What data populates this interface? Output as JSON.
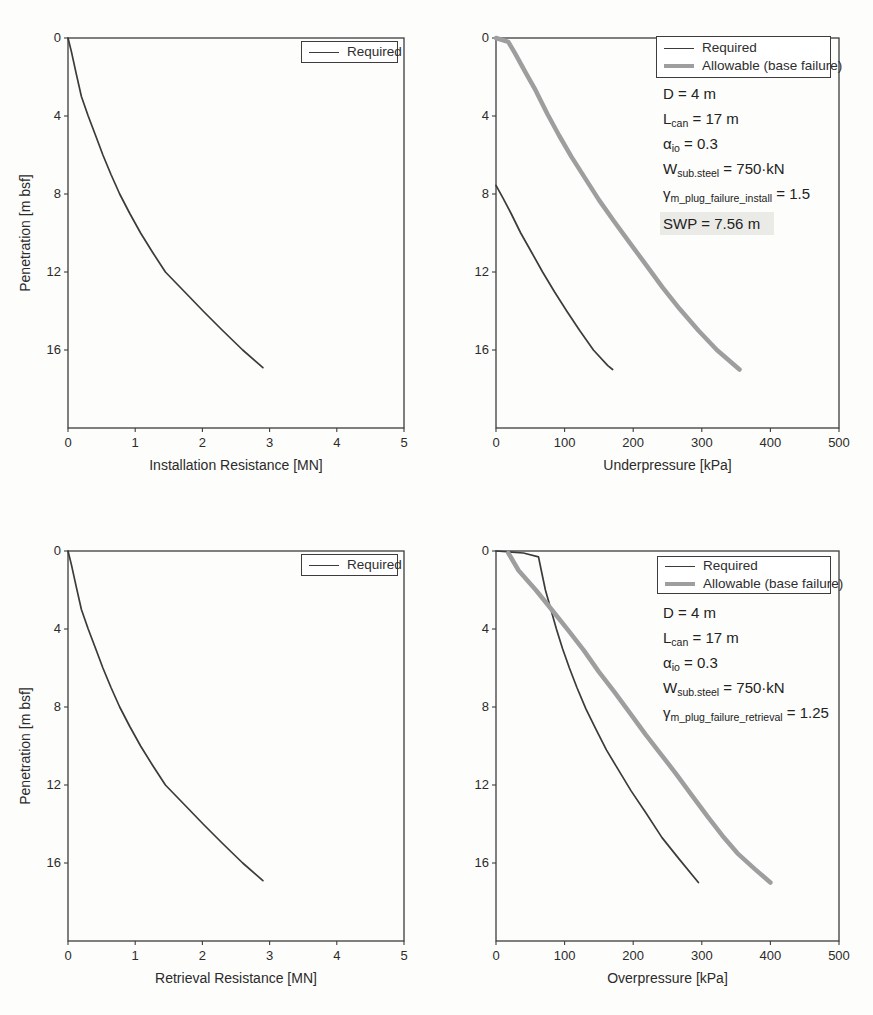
{
  "colors": {
    "required_line": "#3b3b3b",
    "allowable_line": "#9e9e9e",
    "axis": "#3d3d3d",
    "text": "#2b2b2b",
    "highlight_bg": "#eaeae7",
    "background": "#fdfdfb"
  },
  "chart_data": [
    {
      "type": "line",
      "xlabel": "Installation Resistance [MN]",
      "ylabel": "Penetration [m bsf]",
      "xlim": [
        0,
        5
      ],
      "ylim": [
        0,
        20
      ],
      "xticks": [
        0,
        1,
        2,
        3,
        4,
        5
      ],
      "yticks": [
        0,
        4,
        8,
        12,
        16
      ],
      "y_axis_direction": "depth-down",
      "grid": false,
      "legend_position": "top-right",
      "legend": [
        {
          "label": "Required",
          "style": "thin-black"
        }
      ],
      "series": [
        {
          "name": "Required",
          "color": "#3b3b3b",
          "width": 1.7,
          "points": [
            [
              0,
              0
            ],
            [
              0.05,
              0.7
            ],
            [
              0.12,
              1.8
            ],
            [
              0.2,
              3
            ],
            [
              0.3,
              4
            ],
            [
              0.41,
              5
            ],
            [
              0.52,
              6
            ],
            [
              0.64,
              7
            ],
            [
              0.77,
              8
            ],
            [
              0.92,
              9
            ],
            [
              1.08,
              10
            ],
            [
              1.26,
              11
            ],
            [
              1.45,
              12
            ],
            [
              1.73,
              13
            ],
            [
              2.01,
              14
            ],
            [
              2.3,
              15
            ],
            [
              2.6,
              16
            ],
            [
              2.9,
              16.9
            ]
          ]
        }
      ],
      "annotations": []
    },
    {
      "type": "line",
      "xlabel": "Underpressure [kPa]",
      "ylabel": "",
      "xlim": [
        0,
        500
      ],
      "ylim": [
        0,
        20
      ],
      "xticks": [
        0,
        100,
        200,
        300,
        400,
        500
      ],
      "yticks": [
        0,
        4,
        8,
        12,
        16
      ],
      "y_axis_direction": "depth-down",
      "grid": false,
      "legend_position": "top-right",
      "legend": [
        {
          "label": "Required",
          "style": "thin-black"
        },
        {
          "label": "Allowable (base failure)",
          "style": "thick-gray"
        }
      ],
      "series": [
        {
          "name": "Required",
          "color": "#3b3b3b",
          "width": 1.7,
          "points": [
            [
              0,
              7.56
            ],
            [
              10,
              8.2
            ],
            [
              22,
              9
            ],
            [
              36,
              10
            ],
            [
              52,
              11
            ],
            [
              68,
              12
            ],
            [
              85,
              13
            ],
            [
              103,
              14
            ],
            [
              122,
              15
            ],
            [
              142,
              16
            ],
            [
              163,
              16.8
            ],
            [
              170,
              17
            ]
          ]
        },
        {
          "name": "Allowable (base failure)",
          "color": "#9e9e9e",
          "width": 4.5,
          "points": [
            [
              0,
              0
            ],
            [
              18,
              0.2
            ],
            [
              28,
              0.8
            ],
            [
              42,
              1.7
            ],
            [
              58,
              2.7
            ],
            [
              75,
              3.9
            ],
            [
              92,
              5
            ],
            [
              110,
              6.1
            ],
            [
              130,
              7.2
            ],
            [
              150,
              8.3
            ],
            [
              172,
              9.4
            ],
            [
              195,
              10.5
            ],
            [
              218,
              11.6
            ],
            [
              243,
              12.8
            ],
            [
              268,
              13.9
            ],
            [
              295,
              15
            ],
            [
              322,
              16
            ],
            [
              355,
              17
            ]
          ]
        }
      ],
      "annotations": [
        {
          "base": "D",
          "sub": "",
          "rest": " = 4 m"
        },
        {
          "base": "L",
          "sub": "can",
          "rest": " = 17 m"
        },
        {
          "base": "α",
          "sub": "io",
          "rest": " = 0.3"
        },
        {
          "base": "W",
          "sub": "sub.steel",
          "rest": " = 750·kN"
        },
        {
          "base": "γ",
          "sub": "m_plug_failure_install",
          "rest": " = 1.5"
        },
        {
          "base": "SWP",
          "sub": "",
          "rest": " = 7.56 m",
          "highlight": true
        }
      ]
    },
    {
      "type": "line",
      "xlabel": "Retrieval Resistance [MN]",
      "ylabel": "Penetration [m bsf]",
      "xlim": [
        0,
        5
      ],
      "ylim": [
        0,
        20
      ],
      "xticks": [
        0,
        1,
        2,
        3,
        4,
        5
      ],
      "yticks": [
        0,
        4,
        8,
        12,
        16
      ],
      "y_axis_direction": "depth-down",
      "grid": false,
      "legend_position": "top-right",
      "legend": [
        {
          "label": "Required",
          "style": "thin-black"
        }
      ],
      "series": [
        {
          "name": "Required",
          "color": "#3b3b3b",
          "width": 1.7,
          "points": [
            [
              0,
              0
            ],
            [
              0.05,
              0.7
            ],
            [
              0.12,
              1.8
            ],
            [
              0.2,
              3
            ],
            [
              0.3,
              4
            ],
            [
              0.41,
              5
            ],
            [
              0.52,
              6
            ],
            [
              0.64,
              7
            ],
            [
              0.77,
              8
            ],
            [
              0.92,
              9
            ],
            [
              1.08,
              10
            ],
            [
              1.26,
              11
            ],
            [
              1.45,
              12
            ],
            [
              1.73,
              13
            ],
            [
              2.01,
              14
            ],
            [
              2.3,
              15
            ],
            [
              2.6,
              16
            ],
            [
              2.9,
              16.9
            ]
          ]
        }
      ],
      "annotations": []
    },
    {
      "type": "line",
      "xlabel": "Overpressure [kPa]",
      "ylabel": "",
      "xlim": [
        0,
        500
      ],
      "ylim": [
        0,
        20
      ],
      "xticks": [
        0,
        100,
        200,
        300,
        400,
        500
      ],
      "yticks": [
        0,
        4,
        8,
        12,
        16
      ],
      "y_axis_direction": "depth-down",
      "grid": false,
      "legend_position": "top-right",
      "legend": [
        {
          "label": "Required",
          "style": "thin-black"
        },
        {
          "label": "Allowable (base failure)",
          "style": "thick-gray"
        }
      ],
      "series": [
        {
          "name": "Required",
          "color": "#3b3b3b",
          "width": 1.7,
          "points": [
            [
              0,
              0
            ],
            [
              40,
              0.1
            ],
            [
              62,
              0.3
            ],
            [
              66,
              1
            ],
            [
              72,
              2
            ],
            [
              80,
              3
            ],
            [
              88,
              4
            ],
            [
              97,
              5
            ],
            [
              107,
              6
            ],
            [
              118,
              7
            ],
            [
              131,
              8.1
            ],
            [
              145,
              9.1
            ],
            [
              161,
              10.2
            ],
            [
              178,
              11.2
            ],
            [
              197,
              12.3
            ],
            [
              218,
              13.4
            ],
            [
              242,
              14.7
            ],
            [
              267,
              15.8
            ],
            [
              295,
              17
            ]
          ]
        },
        {
          "name": "Allowable (base failure)",
          "color": "#9e9e9e",
          "width": 4.5,
          "points": [
            [
              18,
              0.1
            ],
            [
              33,
              1
            ],
            [
              58,
              2
            ],
            [
              81,
              3
            ],
            [
              106,
              4.1
            ],
            [
              128,
              5.1
            ],
            [
              150,
              6.2
            ],
            [
              172,
              7.2
            ],
            [
              195,
              8.3
            ],
            [
              218,
              9.4
            ],
            [
              240,
              10.4
            ],
            [
              262,
              11.4
            ],
            [
              285,
              12.5
            ],
            [
              308,
              13.6
            ],
            [
              330,
              14.6
            ],
            [
              352,
              15.5
            ],
            [
              377,
              16.3
            ],
            [
              400,
              17
            ]
          ]
        }
      ],
      "annotations": [
        {
          "base": "D",
          "sub": "",
          "rest": " = 4 m"
        },
        {
          "base": "L",
          "sub": "can",
          "rest": " = 17 m"
        },
        {
          "base": "α",
          "sub": "io",
          "rest": " = 0.3"
        },
        {
          "base": "W",
          "sub": "sub.steel",
          "rest": " = 750·kN"
        },
        {
          "base": "γ",
          "sub": "m_plug_failure_retrieval",
          "rest": " = 1.25"
        }
      ]
    }
  ]
}
